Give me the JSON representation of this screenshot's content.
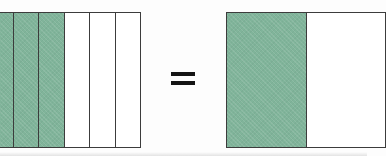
{
  "diagram": {
    "title": "Equivalent fractions area model",
    "type": "fraction-bar-equivalence",
    "relation_symbol": "=",
    "background_color": "#fdfdfd",
    "shaded_color": "#80b49a",
    "unshaded_color": "#ffffff",
    "outline_color": "#3c3c3c",
    "statement": "3/6 = 1/2"
  },
  "left_model": {
    "name": "six-part bar",
    "total_parts": 6,
    "shaded_parts": 3,
    "fraction": "3/6",
    "clipped_left_edge": true,
    "cells": [
      {
        "index": 1,
        "shaded": true,
        "state": "shaded"
      },
      {
        "index": 2,
        "shaded": true,
        "state": "shaded"
      },
      {
        "index": 3,
        "shaded": true,
        "state": "shaded"
      },
      {
        "index": 4,
        "shaded": false,
        "state": "unshaded"
      },
      {
        "index": 5,
        "shaded": false,
        "state": "unshaded"
      },
      {
        "index": 6,
        "shaded": false,
        "state": "unshaded"
      }
    ]
  },
  "right_model": {
    "name": "two-part bar",
    "total_parts": 2,
    "shaded_parts": 1,
    "fraction": "1/2",
    "clipped_right_edge": true,
    "cells": [
      {
        "index": 1,
        "shaded": true,
        "state": "shaded"
      },
      {
        "index": 2,
        "shaded": false,
        "state": "unshaded"
      }
    ]
  }
}
